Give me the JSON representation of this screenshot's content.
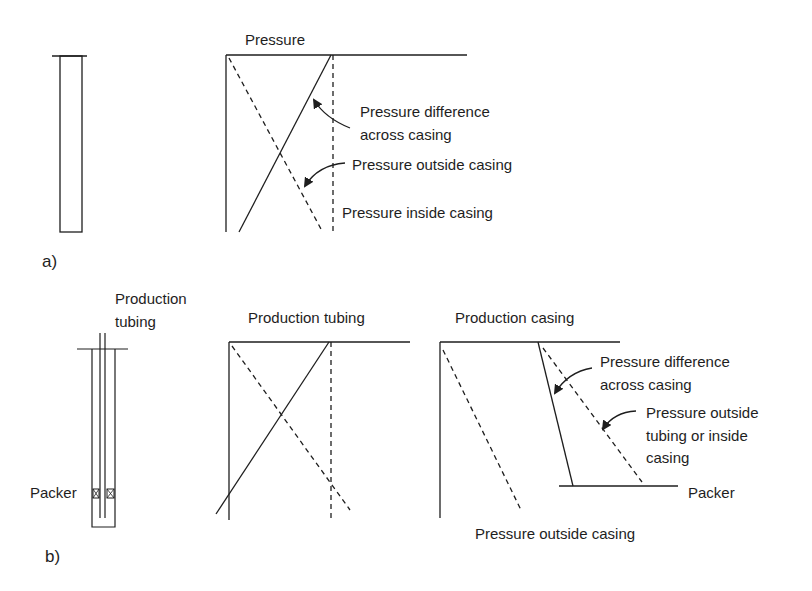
{
  "panel_a": {
    "tag": "a)",
    "plot_title": "Pressure",
    "labels": {
      "difference_line1": "Pressure difference",
      "difference_line2": "across casing",
      "outside": "Pressure outside casing",
      "inside": "Pressure inside casing"
    }
  },
  "panel_b": {
    "tag": "b)",
    "well_label_line1": "Production",
    "well_label_line2": "tubing",
    "packer_label": "Packer",
    "tubing_plot": {
      "title": "Production tubing"
    },
    "casing_plot": {
      "title": "Production casing",
      "labels": {
        "difference_line1": "Pressure difference",
        "difference_line2": "across casing",
        "outside_tubing_line1": "Pressure outside",
        "outside_tubing_line2": "tubing or inside",
        "outside_tubing_line3": "casing",
        "packer": "Packer",
        "outside_casing": "Pressure outside casing"
      }
    }
  },
  "colors": {
    "line": "#1e1e1e",
    "background": "#ffffff"
  }
}
